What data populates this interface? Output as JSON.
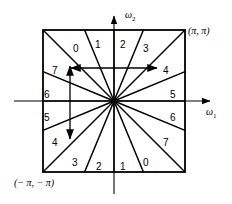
{
  "figure": {
    "axes": {
      "x_label": "ω",
      "x_sub": "1",
      "y_label": "ω",
      "y_sub": "2"
    },
    "corner_labels": [
      {
        "name": "top-right",
        "text": "(π, π)",
        "x": 188,
        "y": 26
      },
      {
        "name": "bottom-left",
        "text": "(− π, − π)",
        "x": 14,
        "y": 178
      }
    ],
    "sectors": [
      {
        "label": "0",
        "x": 73,
        "y": 44
      },
      {
        "label": "1",
        "x": 95,
        "y": 40
      },
      {
        "label": "2",
        "x": 120,
        "y": 40
      },
      {
        "label": "3",
        "x": 143,
        "y": 44
      },
      {
        "label": "4",
        "x": 163,
        "y": 66
      },
      {
        "label": "5",
        "x": 170,
        "y": 90
      },
      {
        "label": "6",
        "x": 170,
        "y": 113
      },
      {
        "label": "7",
        "x": 163,
        "y": 138
      },
      {
        "label": "0",
        "x": 143,
        "y": 158
      },
      {
        "label": "1",
        "x": 120,
        "y": 162
      },
      {
        "label": "2",
        "x": 96,
        "y": 162
      },
      {
        "label": "3",
        "x": 72,
        "y": 158
      },
      {
        "label": "4",
        "x": 52,
        "y": 138
      },
      {
        "label": "5",
        "x": 44,
        "y": 113
      },
      {
        "label": "6",
        "x": 44,
        "y": 90
      },
      {
        "label": "7",
        "x": 52,
        "y": 66
      }
    ],
    "geometry": {
      "center_x": 114,
      "center_y": 101,
      "square_left": 43,
      "square_top": 30,
      "square_right": 185,
      "square_bottom": 172,
      "sector_count": 16,
      "sector_angle_deg": 22.5,
      "x_axis_start": 14,
      "x_axis_end": 214,
      "y_axis_top": 12,
      "y_axis_bottom": 196
    },
    "annotations": [
      {
        "name": "horizontal-span-arrow",
        "x1": 70,
        "y1": 68,
        "x2": 158,
        "y2": 68
      },
      {
        "name": "vertical-span-arrow",
        "x1": 70,
        "y1": 65,
        "x2": 70,
        "y2": 140
      }
    ],
    "colors": {
      "line": "#000000",
      "axis": "#000000",
      "background": "#ffffff"
    }
  }
}
